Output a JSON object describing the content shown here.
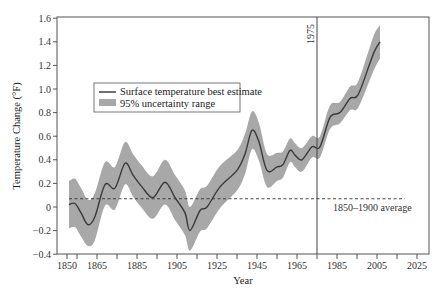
{
  "chart_data": {
    "type": "line",
    "title": "",
    "xlabel": "Year",
    "ylabel": "Temperature Change (°F)",
    "xlim": [
      1845,
      2026
    ],
    "ylim": [
      -0.4,
      1.6
    ],
    "x_ticks": [
      1850,
      1865,
      1885,
      1905,
      1925,
      1945,
      1965,
      1985,
      2005,
      2025
    ],
    "y_ticks": [
      -0.4,
      -0.2,
      0,
      0.2,
      0.4,
      0.6,
      0.8,
      1.0,
      1.2,
      1.4,
      1.6
    ],
    "y_tick_labels": [
      "−0.4",
      "−0.2",
      "0",
      "0.2",
      "0.4",
      "0.6",
      "0.8",
      "1.0",
      "1.2",
      "1.4",
      "1.6"
    ],
    "grid": false,
    "legend_position": "upper-left",
    "series": [
      {
        "name": "Surface temperature best estimate",
        "x": [
          1851,
          1854,
          1857,
          1860.5,
          1864,
          1869,
          1874,
          1879,
          1883,
          1887.5,
          1893,
          1899,
          1904,
          1909,
          1911.5,
          1916.5,
          1920,
          1926.5,
          1935,
          1939,
          1942.5,
          1946,
          1950,
          1955,
          1958,
          1961.5,
          1964,
          1967.5,
          1972.5,
          1976.5,
          1981.5,
          1986.5,
          1991.5,
          1995.5,
          2001.5,
          2004,
          2006.5
        ],
        "y": [
          0.02,
          0.03,
          -0.05,
          -0.15,
          -0.08,
          0.19,
          0.16,
          0.37,
          0.27,
          0.17,
          0.08,
          0.21,
          0.08,
          -0.05,
          -0.2,
          -0.03,
          0.0,
          0.17,
          0.31,
          0.45,
          0.65,
          0.55,
          0.31,
          0.34,
          0.36,
          0.48,
          0.44,
          0.4,
          0.51,
          0.51,
          0.76,
          0.8,
          0.92,
          0.95,
          1.22,
          1.33,
          1.4
        ]
      },
      {
        "name": "95% uncertainty range",
        "x": [
          1851,
          1854,
          1857,
          1860.5,
          1864,
          1869,
          1874,
          1879,
          1883,
          1887.5,
          1893,
          1899,
          1904,
          1909,
          1911.5,
          1916.5,
          1920,
          1926.5,
          1935,
          1939,
          1942.5,
          1946,
          1950,
          1955,
          1958,
          1961.5,
          1964,
          1967.5,
          1972.5,
          1976.5,
          1981.5,
          1986.5,
          1991.5,
          1995.5,
          2001.5,
          2004,
          2006.5
        ],
        "upper": [
          0.22,
          0.24,
          0.16,
          0.06,
          0.12,
          0.38,
          0.34,
          0.55,
          0.45,
          0.35,
          0.26,
          0.4,
          0.27,
          0.14,
          0.0,
          0.15,
          0.18,
          0.35,
          0.48,
          0.62,
          0.81,
          0.71,
          0.45,
          0.46,
          0.47,
          0.58,
          0.54,
          0.5,
          0.6,
          0.6,
          0.86,
          0.89,
          1.02,
          1.06,
          1.36,
          1.48,
          1.54
        ],
        "lower": [
          -0.18,
          -0.17,
          -0.25,
          -0.33,
          -0.28,
          0.01,
          -0.02,
          0.19,
          0.09,
          -0.01,
          -0.1,
          0.02,
          -0.11,
          -0.24,
          -0.37,
          -0.21,
          -0.18,
          -0.01,
          0.14,
          0.28,
          0.49,
          0.39,
          0.17,
          0.22,
          0.25,
          0.38,
          0.34,
          0.3,
          0.42,
          0.42,
          0.66,
          0.71,
          0.82,
          0.84,
          1.08,
          1.18,
          1.26
        ]
      }
    ],
    "reference_lines": [
      {
        "type": "horizontal",
        "y": 0.07,
        "style": "dashed",
        "label": "1850–1900 average"
      },
      {
        "type": "vertical",
        "x": 1975,
        "style": "solid",
        "label": "1975"
      }
    ],
    "legend": [
      {
        "label": "Surface temperature best estimate",
        "symbol": "line"
      },
      {
        "label": "95% uncertainty range",
        "symbol": "patch"
      }
    ],
    "colors": {
      "line": "#3a3a3a",
      "band": "#a8a8a8",
      "axis": "#555555"
    }
  }
}
